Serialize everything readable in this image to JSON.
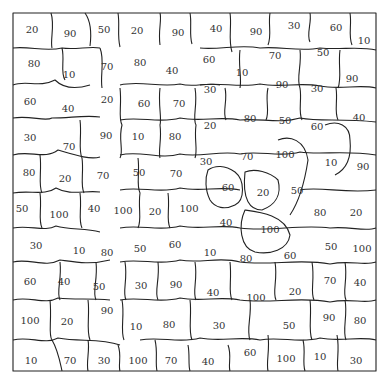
{
  "frame": {
    "x": 13,
    "y": 13,
    "w": 363,
    "h": 358,
    "stroke": "#222222"
  },
  "regions": [
    {
      "v": "20",
      "x": 32,
      "y": 29
    },
    {
      "v": "90",
      "x": 70,
      "y": 33
    },
    {
      "v": "50",
      "x": 104,
      "y": 29
    },
    {
      "v": "20",
      "x": 137,
      "y": 30
    },
    {
      "v": "90",
      "x": 178,
      "y": 32
    },
    {
      "v": "40",
      "x": 216,
      "y": 28
    },
    {
      "v": "90",
      "x": 256,
      "y": 31
    },
    {
      "v": "30",
      "x": 294,
      "y": 25
    },
    {
      "v": "60",
      "x": 336,
      "y": 27
    },
    {
      "v": "10",
      "x": 364,
      "y": 40
    },
    {
      "v": "80",
      "x": 34,
      "y": 63
    },
    {
      "v": "10",
      "x": 69,
      "y": 74
    },
    {
      "v": "70",
      "x": 107,
      "y": 66
    },
    {
      "v": "80",
      "x": 140,
      "y": 62
    },
    {
      "v": "40",
      "x": 172,
      "y": 70
    },
    {
      "v": "60",
      "x": 209,
      "y": 59
    },
    {
      "v": "10",
      "x": 242,
      "y": 72
    },
    {
      "v": "70",
      "x": 275,
      "y": 55
    },
    {
      "v": "50",
      "x": 323,
      "y": 52
    },
    {
      "v": "90",
      "x": 352,
      "y": 78
    },
    {
      "v": "60",
      "x": 30,
      "y": 101
    },
    {
      "v": "40",
      "x": 68,
      "y": 108
    },
    {
      "v": "20",
      "x": 107,
      "y": 99
    },
    {
      "v": "60",
      "x": 144,
      "y": 103
    },
    {
      "v": "70",
      "x": 179,
      "y": 103
    },
    {
      "v": "30",
      "x": 210,
      "y": 89
    },
    {
      "v": "90",
      "x": 282,
      "y": 84
    },
    {
      "v": "30",
      "x": 317,
      "y": 88
    },
    {
      "v": "30",
      "x": 30,
      "y": 137
    },
    {
      "v": "70",
      "x": 69,
      "y": 146
    },
    {
      "v": "90",
      "x": 106,
      "y": 135
    },
    {
      "v": "10",
      "x": 138,
      "y": 136
    },
    {
      "v": "80",
      "x": 175,
      "y": 136
    },
    {
      "v": "20",
      "x": 210,
      "y": 125
    },
    {
      "v": "80",
      "x": 250,
      "y": 118
    },
    {
      "v": "50",
      "x": 285,
      "y": 120
    },
    {
      "v": "60",
      "x": 317,
      "y": 126
    },
    {
      "v": "40",
      "x": 359,
      "y": 117
    },
    {
      "v": "80",
      "x": 29,
      "y": 172
    },
    {
      "v": "20",
      "x": 65,
      "y": 178
    },
    {
      "v": "70",
      "x": 103,
      "y": 175
    },
    {
      "v": "50",
      "x": 139,
      "y": 172
    },
    {
      "v": "70",
      "x": 176,
      "y": 173
    },
    {
      "v": "30",
      "x": 206,
      "y": 161
    },
    {
      "v": "70",
      "x": 247,
      "y": 156
    },
    {
      "v": "100",
      "x": 285,
      "y": 154
    },
    {
      "v": "10",
      "x": 331,
      "y": 162
    },
    {
      "v": "90",
      "x": 363,
      "y": 166
    },
    {
      "v": "50",
      "x": 22,
      "y": 208
    },
    {
      "v": "100",
      "x": 59,
      "y": 214
    },
    {
      "v": "40",
      "x": 94,
      "y": 208
    },
    {
      "v": "100",
      "x": 123,
      "y": 210
    },
    {
      "v": "20",
      "x": 155,
      "y": 211
    },
    {
      "v": "100",
      "x": 189,
      "y": 208
    },
    {
      "v": "60",
      "x": 228,
      "y": 187
    },
    {
      "v": "20",
      "x": 263,
      "y": 192
    },
    {
      "v": "50",
      "x": 297,
      "y": 190
    },
    {
      "v": "80",
      "x": 320,
      "y": 212
    },
    {
      "v": "20",
      "x": 356,
      "y": 212
    },
    {
      "v": "40",
      "x": 226,
      "y": 222
    },
    {
      "v": "100",
      "x": 270,
      "y": 229
    },
    {
      "v": "30",
      "x": 36,
      "y": 245
    },
    {
      "v": "10",
      "x": 79,
      "y": 250
    },
    {
      "v": "80",
      "x": 107,
      "y": 252
    },
    {
      "v": "50",
      "x": 140,
      "y": 248
    },
    {
      "v": "60",
      "x": 175,
      "y": 244
    },
    {
      "v": "10",
      "x": 210,
      "y": 252
    },
    {
      "v": "80",
      "x": 246,
      "y": 258
    },
    {
      "v": "60",
      "x": 290,
      "y": 255
    },
    {
      "v": "50",
      "x": 331,
      "y": 246
    },
    {
      "v": "100",
      "x": 362,
      "y": 248
    },
    {
      "v": "60",
      "x": 30,
      "y": 281
    },
    {
      "v": "40",
      "x": 64,
      "y": 281
    },
    {
      "v": "50",
      "x": 99,
      "y": 286
    },
    {
      "v": "30",
      "x": 141,
      "y": 285
    },
    {
      "v": "90",
      "x": 176,
      "y": 284
    },
    {
      "v": "40",
      "x": 213,
      "y": 292
    },
    {
      "v": "100",
      "x": 256,
      "y": 297
    },
    {
      "v": "20",
      "x": 295,
      "y": 291
    },
    {
      "v": "70",
      "x": 330,
      "y": 280
    },
    {
      "v": "40",
      "x": 360,
      "y": 282
    },
    {
      "v": "100",
      "x": 30,
      "y": 320
    },
    {
      "v": "20",
      "x": 67,
      "y": 321
    },
    {
      "v": "90",
      "x": 107,
      "y": 310
    },
    {
      "v": "10",
      "x": 136,
      "y": 326
    },
    {
      "v": "80",
      "x": 169,
      "y": 324
    },
    {
      "v": "30",
      "x": 219,
      "y": 325
    },
    {
      "v": "50",
      "x": 289,
      "y": 325
    },
    {
      "v": "90",
      "x": 329,
      "y": 317
    },
    {
      "v": "80",
      "x": 360,
      "y": 320
    },
    {
      "v": "10",
      "x": 31,
      "y": 360
    },
    {
      "v": "70",
      "x": 70,
      "y": 360
    },
    {
      "v": "30",
      "x": 104,
      "y": 360
    },
    {
      "v": "100",
      "x": 138,
      "y": 360
    },
    {
      "v": "70",
      "x": 171,
      "y": 360
    },
    {
      "v": "40",
      "x": 208,
      "y": 361
    },
    {
      "v": "60",
      "x": 250,
      "y": 352
    },
    {
      "v": "100",
      "x": 286,
      "y": 358
    },
    {
      "v": "10",
      "x": 320,
      "y": 356
    },
    {
      "v": "30",
      "x": 356,
      "y": 360
    }
  ],
  "boundaries": [
    "M13 13 L376 13 L376 371 L13 371 Z",
    "M13 48 C30 46 45 52 62 48 C75 50 90 46 100 48",
    "M51 13 C55 25 50 40 52 48",
    "M85 13 C90 20 92 30 90 46",
    "M118 13 C120 25 117 35 120 47",
    "M160 13 C162 20 158 30 160 45",
    "M190 13 C192 22 189 35 192 44",
    "M13 85 C25 80 40 88 55 80 C65 90 80 88 90 85",
    "M62 48 C65 60 60 72 65 80",
    "M100 48 C105 60 100 75 102 88",
    "M13 118 C30 115 45 122 52 118 C70 118 85 115 100 117",
    "M13 155 C30 150 45 160 58 150 C75 155 90 160 100 157",
    "M13 193 C30 190 45 196 56 188 C70 196 85 190 100 192",
    "M13 228 C30 225 45 232 56 226 C70 230 85 228 100 232",
    "M13 262 C30 258 45 268 60 260 C75 262 90 265 110 260",
    "M13 300 C30 296 45 305 58 298 C75 300 90 298 110 300",
    "M13 340 C30 336 45 345 58 338 C80 342 100 338 120 345",
    "M50 300 C52 320 48 335 52 340 C58 350 60 362 62 371",
    "M88 340 C90 350 86 362 88 371",
    "M118 345 C122 355 118 365 120 371",
    "M155 340 C158 352 155 362 157 371",
    "M188 345 C190 355 188 365 190 371",
    "M228 345 C232 355 228 365 230 371",
    "M268 335 C270 350 266 362 268 371",
    "M303 340 C306 352 302 362 305 371",
    "M337 335 C340 350 336 362 338 371",
    "M200 48 C220 50 240 44 260 48 C280 46 300 52 320 48 C340 50 360 46 376 50",
    "M230 13 C232 25 228 40 232 52",
    "M270 13 C268 25 272 35 268 45",
    "M310 13 C312 22 306 35 310 42",
    "M350 13 C352 25 348 35 352 45",
    "M200 85 C220 82 240 88 260 84 C280 88 300 82 320 86 C340 90 360 84 376 88",
    "M240 50 C238 65 242 78 240 88",
    "M300 50 C302 65 296 78 300 88",
    "M340 50 C338 65 342 78 338 88",
    "M120 85 C140 80 160 88 180 84 C195 88 205 82 220 85",
    "M120 120 C140 116 160 124 180 118 C200 122 220 116 240 120 C260 118 280 124 300 118 C320 122 340 118 376 122",
    "M120 155 C140 150 160 160 180 154 C200 158 220 150 240 154 C260 150 280 158 300 152 C320 155 345 150 376 155",
    "M120 190 C140 186 160 194 180 188 C200 192 220 186 240 190",
    "M300 190 C320 186 345 194 376 190",
    "M120 228 C140 224 160 232 180 226 C200 230 220 224 240 228 C270 232 300 224 330 228 C350 226 365 232 376 228",
    "M120 262 C140 258 160 266 180 260 C200 264 220 256 240 262 C270 266 300 258 330 264 C350 260 365 266 376 262",
    "M120 300 C140 296 160 304 180 298 C200 302 220 296 240 300 C270 304 300 296 330 302 C350 298 365 304 376 300",
    "M140 340 C160 336 180 344 200 338 C220 342 240 336 260 340 C280 336 300 344 320 338 C340 342 360 336 376 340",
    "M120 88 C122 105 118 118 122 125 C118 140 124 150 120 158",
    "M160 88 C158 105 162 118 160 125 C162 140 158 150 160 158",
    "M195 88 C198 105 192 118 196 125 C194 140 198 150 195 158",
    "M225 88 C228 100 222 112 226 120",
    "M268 88 C265 100 270 112 266 120",
    "M300 88 C302 100 298 112 302 120",
    "M336 88 C338 100 334 112 338 120",
    "M80 120 C82 135 78 150 82 158",
    "M40 155 C42 170 38 185 42 193",
    "M82 158 C84 172 80 185 84 193",
    "M40 193 C42 208 38 220 42 228",
    "M80 193 C82 208 78 220 82 228",
    "M138 158 C140 172 136 185 140 193 C138 208 142 220 138 228",
    "M168 193 C170 208 166 220 170 228",
    "M208 170 C215 165 225 165 235 172 C245 180 245 200 235 205 C225 210 215 208 210 200 C205 190 205 178 208 170 Z",
    "M245 172 C255 168 270 172 278 180 C282 195 275 205 262 210 C250 210 242 200 245 172 Z",
    "M245 210 C260 212 285 215 290 235 C288 250 270 255 255 252 C240 248 238 225 245 210 Z",
    "M278 140 C290 135 305 140 308 160 C305 180 300 200 290 215",
    "M325 125 C338 120 350 125 350 140 C352 160 345 170 335 175",
    "M60 262 C62 280 56 292 60 300",
    "M96 262 C98 280 92 292 96 300",
    "M125 262 C128 280 122 292 126 300",
    "M158 262 C160 280 154 292 158 300",
    "M195 262 C198 280 192 292 196 300",
    "M230 262 C232 280 228 292 232 300",
    "M275 262 C278 280 272 292 276 300",
    "M312 262 C315 280 310 292 314 300",
    "M345 262 C348 280 342 292 346 300",
    "M88 300 C90 315 86 330 90 340",
    "M122 300 C125 315 120 330 124 340",
    "M190 300 C192 315 188 330 192 340",
    "M250 300 C252 315 246 330 250 340",
    "M310 300 C312 315 308 330 312 340",
    "M345 300 C348 315 342 330 346 340"
  ]
}
